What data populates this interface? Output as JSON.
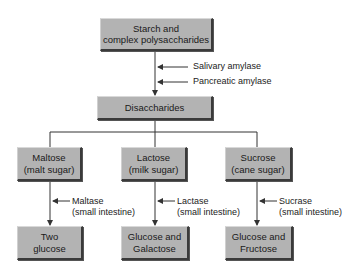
{
  "diagram": {
    "type": "flowchart",
    "colors": {
      "box_fill": "#b3b3b3",
      "line": "#333333",
      "background": "#ffffff"
    },
    "top": {
      "line1": "Starch and",
      "line2": "complex polysaccharides"
    },
    "top_enzymes": [
      "Salivary amylase",
      "Pancreatic amylase"
    ],
    "middle": {
      "label": "Disaccharides"
    },
    "branches": [
      {
        "sugar": {
          "line1": "Maltose",
          "line2": "(malt sugar)"
        },
        "enzyme": {
          "line1": "Maltase",
          "line2": "(small intestine)"
        },
        "product": {
          "line1": "Two",
          "line2": "glucose"
        }
      },
      {
        "sugar": {
          "line1": "Lactose",
          "line2": "(milk sugar)"
        },
        "enzyme": {
          "line1": "Lactase",
          "line2": "(small intestine)"
        },
        "product": {
          "line1": "Glucose and",
          "line2": "Galactose"
        }
      },
      {
        "sugar": {
          "line1": "Sucrose",
          "line2": "(cane sugar)"
        },
        "enzyme": {
          "line1": "Sucrase",
          "line2": "(small intestine)"
        },
        "product": {
          "line1": "Glucose and",
          "line2": "Fructose"
        }
      }
    ]
  }
}
